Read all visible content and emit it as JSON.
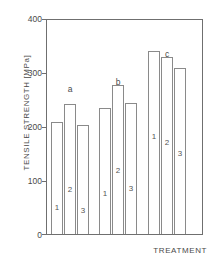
{
  "chart_data": {
    "type": "bar",
    "title": "",
    "xlabel": "TREATMENT",
    "ylabel": "TENSILE STRENGTH [MPa]",
    "ylim": [
      0,
      400
    ],
    "yticks": [
      0,
      100,
      200,
      300,
      400
    ],
    "ytick_labels": [
      "0",
      "100",
      "200",
      "300",
      "400"
    ],
    "grid": false,
    "legend": "none",
    "groups": [
      {
        "label": "a",
        "bars": [
          {
            "index": "1",
            "value": 209
          },
          {
            "index": "2",
            "value": 241
          },
          {
            "index": "3",
            "value": 202
          }
        ]
      },
      {
        "label": "b",
        "bars": [
          {
            "index": "1",
            "value": 235
          },
          {
            "index": "2",
            "value": 277
          },
          {
            "index": "3",
            "value": 243
          }
        ]
      },
      {
        "label": "c",
        "bars": [
          {
            "index": "1",
            "value": 341
          },
          {
            "index": "2",
            "value": 329
          },
          {
            "index": "3",
            "value": 308
          }
        ]
      }
    ],
    "categories": [
      "a1",
      "a2",
      "a3",
      "b1",
      "b2",
      "b3",
      "c1",
      "c2",
      "c3"
    ],
    "values": [
      209,
      241,
      202,
      235,
      277,
      243,
      341,
      329,
      308
    ],
    "colors": {
      "axis": "#6f6f6f",
      "bar_outline": "#8a8a8a",
      "bar_fill": "#ffffff",
      "text": "#4a4a4a",
      "background": "#ffffff"
    }
  }
}
